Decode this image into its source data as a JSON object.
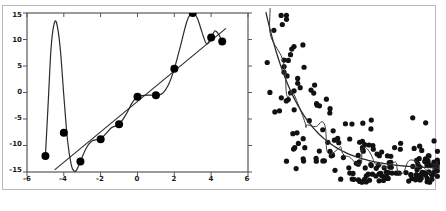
{
  "figure": {
    "caption": "",
    "background": "#ffffff",
    "frame_color": "#b9b9bd",
    "ink_color": "#1a1a1a"
  },
  "chart_data": [
    {
      "type": "scatter",
      "name": "left-panel-polynomial-overfit",
      "title": "",
      "xlabel": "",
      "ylabel": "",
      "xlim": [
        -6,
        6
      ],
      "ylim": [
        -15,
        15
      ],
      "xticks": [
        -6,
        -4,
        -2,
        0,
        2,
        4,
        6
      ],
      "xticklabels": [
        "-6",
        "-4",
        "-2",
        "0",
        "2",
        "4",
        "6"
      ],
      "yticks": [
        -15,
        -10,
        -5,
        0,
        5,
        10,
        15
      ],
      "yticklabels": [
        "-15",
        "-10",
        "-5",
        "0",
        "5",
        "10",
        "15"
      ],
      "grid": false,
      "legend": "none",
      "frame": true,
      "marker_color": "#000000",
      "marker_size": 4,
      "x": [
        -5.0,
        -4.0,
        -3.1,
        -2.0,
        -1.0,
        0.0,
        1.0,
        2.0,
        3.0,
        4.0,
        4.6
      ],
      "y": [
        -12.0,
        -7.6,
        -13.0,
        -8.8,
        -6.0,
        -0.8,
        -0.5,
        4.5,
        15.0,
        10.4,
        9.6
      ],
      "series": [
        {
          "name": "overfit-polynomial-curve",
          "style": "line",
          "color": "#2b2b2b",
          "width": 1.2,
          "points_x": [
            -5.0,
            -4.85,
            -4.7,
            -4.55,
            -4.4,
            -4.2,
            -4.0,
            -3.8,
            -3.6,
            -3.45,
            -3.3,
            -3.1,
            -2.8,
            -2.5,
            -2.2,
            -2.0,
            -1.7,
            -1.4,
            -1.0,
            -0.6,
            -0.3,
            0.0,
            0.35,
            0.7,
            1.0,
            1.35,
            1.7,
            2.0,
            2.35,
            2.7,
            3.0,
            3.25,
            3.5,
            3.75,
            4.0,
            4.2,
            4.4,
            4.6
          ],
          "points_y": [
            -12.0,
            -2.0,
            8.0,
            12.6,
            13.2,
            8.5,
            -0.6,
            -9.0,
            -13.6,
            -14.8,
            -14.6,
            -13.0,
            -10.6,
            -9.2,
            -8.9,
            -8.8,
            -7.7,
            -6.6,
            -6.0,
            -4.0,
            -2.0,
            -0.8,
            -0.55,
            -0.5,
            -0.5,
            -0.2,
            1.6,
            4.5,
            9.0,
            13.6,
            15.0,
            14.0,
            11.4,
            9.2,
            10.4,
            11.6,
            11.0,
            9.6
          ]
        },
        {
          "name": "linear-regression-line",
          "style": "line",
          "color": "#2b2b2b",
          "width": 1.1,
          "points_x": [
            -4.5,
            4.8
          ],
          "points_y": [
            -14.6,
            12.1
          ]
        }
      ]
    },
    {
      "type": "scatter",
      "name": "right-panel-noisy-decay",
      "title": "",
      "xlabel": "",
      "ylabel": "",
      "xlim": [
        0,
        1
      ],
      "ylim": [
        0,
        1
      ],
      "xticks": [],
      "yticks": [],
      "grid": false,
      "legend": "none",
      "frame": false,
      "marker_color": "#111111",
      "marker_size": 2.6,
      "n_points": 186,
      "series": [
        {
          "name": "smooth-fit-curve",
          "style": "line",
          "color": "#2b2b2b",
          "width": 1.3,
          "description": "smooth exponential-decay fit descending steeply from top-left then flattening toward bottom-right"
        },
        {
          "name": "overfit-wiggly-curve",
          "style": "line",
          "color": "#3a3a3a",
          "width": 1.0,
          "description": "high-variance curve with many loops oscillating around the smooth fit"
        }
      ]
    }
  ]
}
